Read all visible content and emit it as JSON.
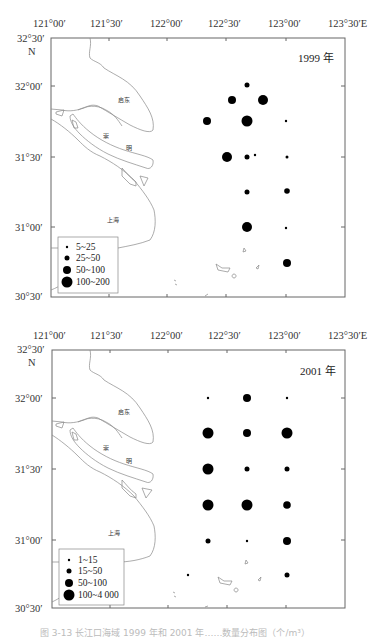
{
  "maps": [
    {
      "id": "map-1999",
      "year_label": "1999 年",
      "lon_ticks": [
        "121°00′",
        "121°30′",
        "122°00′",
        "122°30′",
        "123°00′",
        "123°30′E"
      ],
      "lat_ticks": [
        "32°30′",
        "32°00′",
        "31°30′",
        "31°00′",
        "30°30′"
      ],
      "north_label": "N",
      "place_labels": {
        "qidong": "启东",
        "chong": "崇",
        "ming": "明",
        "shanghai": "上海"
      },
      "legend": {
        "items": [
          {
            "label": "5~25",
            "size_class": 1
          },
          {
            "label": "25~50",
            "size_class": 2
          },
          {
            "label": "50~100",
            "size_class": 3
          },
          {
            "label": "100~200",
            "size_class": 4
          }
        ]
      },
      "stations": [
        {
          "lon": "122°40′",
          "lat": "32°05′",
          "size_class": 2
        },
        {
          "lon": "122°35′",
          "lat": "31°55′",
          "size_class": 3
        },
        {
          "lon": "122°45′",
          "lat": "31°55′",
          "size_class": 4
        },
        {
          "lon": "122°20′",
          "lat": "31°45′",
          "size_class": 3
        },
        {
          "lon": "122°40′",
          "lat": "31°45′",
          "size_class": 4
        },
        {
          "lon": "123°00′",
          "lat": "31°45′",
          "size_class": 1
        },
        {
          "lon": "122°30′",
          "lat": "31°30′",
          "size_class": 4
        },
        {
          "lon": "122°40′",
          "lat": "31°30′",
          "size_class": 2
        },
        {
          "lon": "122°44′",
          "lat": "31°31′",
          "size_class": 1
        },
        {
          "lon": "123°00′",
          "lat": "31°30′",
          "size_class": 1
        },
        {
          "lon": "122°40′",
          "lat": "31°15′",
          "size_class": 2
        },
        {
          "lon": "123°00′",
          "lat": "31°15′",
          "size_class": 2
        },
        {
          "lon": "122°40′",
          "lat": "31°00′",
          "size_class": 4
        },
        {
          "lon": "123°00′",
          "lat": "31°00′",
          "size_class": 1
        },
        {
          "lon": "123°00′",
          "lat": "30°45′",
          "size_class": 3
        }
      ]
    },
    {
      "id": "map-2001",
      "year_label": "2001 年",
      "lon_ticks": [
        "121°00′",
        "121°30′",
        "122°00′",
        "122°30′",
        "123°00′",
        "123°30′E"
      ],
      "lat_ticks": [
        "32°30′",
        "32°00′",
        "31°30′",
        "31°00′",
        "30°30′"
      ],
      "north_label": "N",
      "place_labels": {
        "qidong": "启东",
        "chong": "崇",
        "ming": "明",
        "shanghai": "上海"
      },
      "legend": {
        "items": [
          {
            "label": "1~15",
            "size_class": 1
          },
          {
            "label": "15~50",
            "size_class": 2
          },
          {
            "label": "50~100",
            "size_class": 3
          },
          {
            "label": "100~4 000",
            "size_class": 4
          }
        ]
      },
      "stations": [
        {
          "lon": "122°20′",
          "lat": "32°00′",
          "size_class": 1
        },
        {
          "lon": "122°40′",
          "lat": "32°00′",
          "size_class": 3
        },
        {
          "lon": "123°00′",
          "lat": "32°00′",
          "size_class": 1
        },
        {
          "lon": "122°20′",
          "lat": "31°45′",
          "size_class": 4
        },
        {
          "lon": "122°40′",
          "lat": "31°45′",
          "size_class": 3
        },
        {
          "lon": "123°00′",
          "lat": "31°45′",
          "size_class": 4
        },
        {
          "lon": "122°20′",
          "lat": "31°30′",
          "size_class": 4
        },
        {
          "lon": "122°40′",
          "lat": "31°30′",
          "size_class": 2
        },
        {
          "lon": "123°00′",
          "lat": "31°30′",
          "size_class": 2
        },
        {
          "lon": "122°20′",
          "lat": "31°15′",
          "size_class": 4
        },
        {
          "lon": "122°40′",
          "lat": "31°15′",
          "size_class": 4
        },
        {
          "lon": "123°00′",
          "lat": "31°15′",
          "size_class": 3
        },
        {
          "lon": "122°20′",
          "lat": "31°00′",
          "size_class": 2
        },
        {
          "lon": "122°40′",
          "lat": "31°00′",
          "size_class": 1
        },
        {
          "lon": "123°00′",
          "lat": "31°00′",
          "size_class": 3
        },
        {
          "lon": "122°10′",
          "lat": "30°45′",
          "size_class": 1
        },
        {
          "lon": "123°00′",
          "lat": "30°45′",
          "size_class": 2
        }
      ]
    }
  ],
  "caption": "图 3-13  长江口海域 1999 年和 2001 年……数量分布图（个/m³）"
}
